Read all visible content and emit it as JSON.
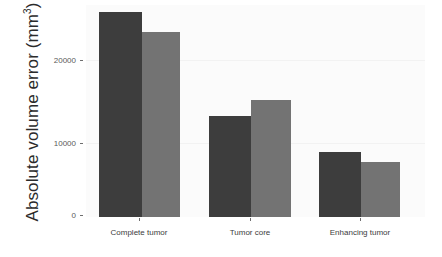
{
  "chart_data": {
    "type": "bar",
    "title": "",
    "subtitle": "",
    "xlabel": "",
    "ylabel": "Absolute volume error  (mm3)",
    "ylabel_base": "Absolute volume error  (mm",
    "ylabel_sup": "3",
    "ylabel_close": ")",
    "categories": [
      "Complete tumor",
      "Tumor core",
      "Enhancing tumor"
    ],
    "series": [
      {
        "name": "series-1",
        "color": "#3d3d3d",
        "values": [
          26600,
          13100,
          8400
        ]
      },
      {
        "name": "series-2",
        "color": "#737373",
        "values": [
          24000,
          15200,
          7100
        ]
      }
    ],
    "ylim": [
      0,
      27500
    ],
    "yticks": [
      0,
      10000,
      20000
    ],
    "ytick_labels": [
      "0",
      "10000",
      "20000"
    ],
    "grid": false,
    "legend": "none",
    "panel_background": "#fbfbfb",
    "figure_background": "#ffffff",
    "axis_text_color": "#5a5a5a"
  }
}
